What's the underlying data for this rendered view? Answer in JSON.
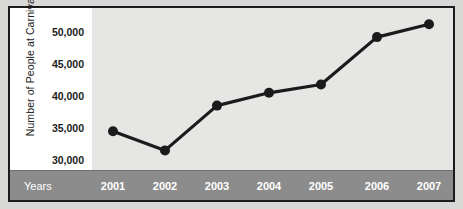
{
  "chart_data": {
    "type": "line",
    "title": "",
    "xlabel": "Years",
    "ylabel": "Number of People at Carnival",
    "categories": [
      "2001",
      "2002",
      "2003",
      "2004",
      "2005",
      "2006",
      "2007"
    ],
    "values": [
      34500,
      31500,
      38500,
      40500,
      41800,
      49200,
      51200
    ],
    "series": [
      {
        "name": "Number of People at Carnival",
        "values": [
          34500,
          31500,
          38500,
          40500,
          41800,
          49200,
          51200
        ]
      }
    ],
    "ylim": [
      28500,
      52500
    ],
    "yticks": [
      30000,
      35000,
      40000,
      45000,
      50000
    ],
    "ytick_labels": [
      "30,000",
      "35,000",
      "40,000",
      "45,000",
      "50,000"
    ],
    "grid": false,
    "legend": false,
    "marker": "filled-circle",
    "line_color": "#1b1b1b",
    "marker_color": "#1b1b1b",
    "plot_background": "#e6e6e4",
    "axis_band_color": "#8c8c8c",
    "axis_band_text_color": "#ffffff",
    "frame_color": "#1b1b1b"
  }
}
